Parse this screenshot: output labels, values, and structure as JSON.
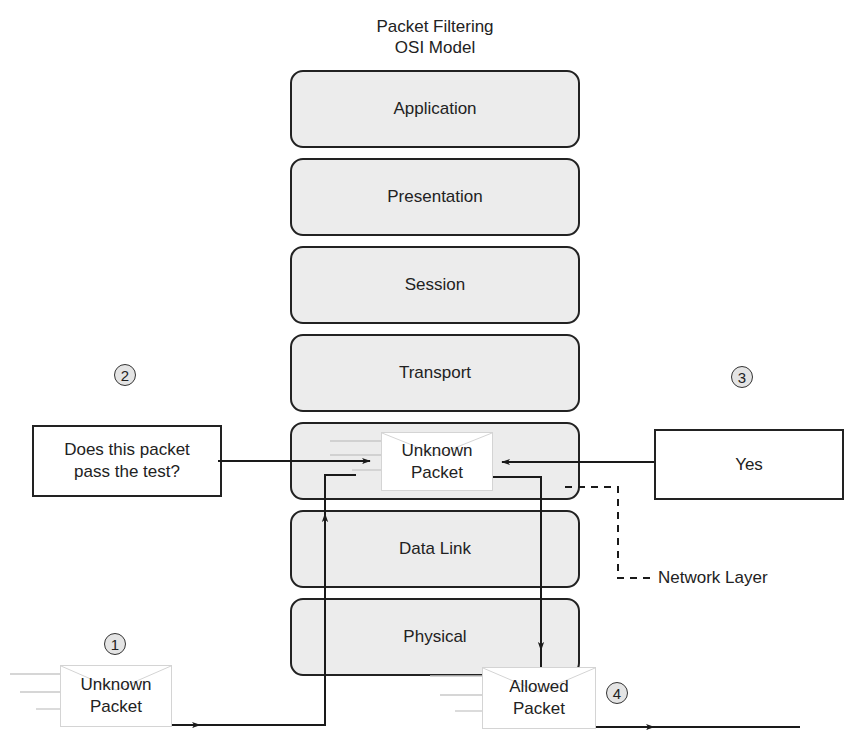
{
  "header": {
    "clipped_caption": "",
    "title_line1": "Packet Filtering",
    "title_line2": "OSI Model"
  },
  "osi_layers": [
    {
      "name": "Application"
    },
    {
      "name": "Presentation"
    },
    {
      "name": "Session"
    },
    {
      "name": "Transport"
    },
    {
      "name": "Network"
    },
    {
      "name": "Data Link"
    },
    {
      "name": "Physical"
    }
  ],
  "steps": [
    {
      "number": "1",
      "packet_line1": "Unknown",
      "packet_line2": "Packet"
    },
    {
      "number": "2",
      "question_line1": "Does this packet",
      "question_line2": "pass the test?"
    },
    {
      "number": "3",
      "answer": "Yes"
    },
    {
      "number": "4",
      "packet_line1": "Allowed",
      "packet_line2": "Packet"
    }
  ],
  "network_packet": {
    "line1": "Unknown",
    "line2": "Packet"
  },
  "callout": {
    "label": "Network Layer"
  },
  "colors": {
    "layer_fill": "#ececec",
    "stroke": "#222222",
    "badge_fill": "#e4e4e4",
    "motion_lines": "#c8c8c8"
  }
}
